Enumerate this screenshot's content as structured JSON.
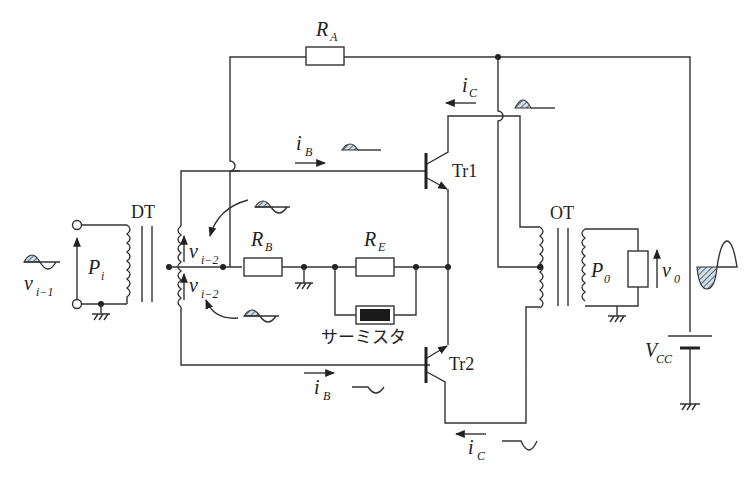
{
  "diagram": {
    "type": "push-pull amplifier circuit",
    "components": {
      "resistor_RA": {
        "label": "R",
        "sub": "A"
      },
      "resistor_RB": {
        "label": "R",
        "sub": "B"
      },
      "resistor_RE": {
        "label": "R",
        "sub": "E"
      },
      "thermistor": {
        "label": "サーミスタ"
      },
      "transistor_1": {
        "label": "Tr1"
      },
      "transistor_2": {
        "label": "Tr2"
      },
      "driver_transformer": {
        "label": "DT"
      },
      "output_transformer": {
        "label": "OT"
      },
      "supply": {
        "label": "V",
        "sub": "CC"
      }
    },
    "signals": {
      "input_voltage": {
        "label": "v",
        "sub": "i−1"
      },
      "input_power": {
        "label": "P",
        "sub": "i"
      },
      "secondary_upper": {
        "label": "v",
        "sub": "i−2"
      },
      "secondary_lower": {
        "label": "v",
        "sub": "i−2"
      },
      "base_current_1": {
        "label": "i",
        "sub": "B"
      },
      "base_current_2": {
        "label": "i",
        "sub": "B"
      },
      "collector_current_1": {
        "label": "i",
        "sub": "C"
      },
      "collector_current_2": {
        "label": "i",
        "sub": "C"
      },
      "output_power": {
        "label": "P",
        "sub": "0"
      },
      "output_voltage": {
        "label": "v",
        "sub": "0"
      }
    },
    "colors": {
      "wire": "#333333",
      "hatch": "#7aa6c2"
    }
  }
}
